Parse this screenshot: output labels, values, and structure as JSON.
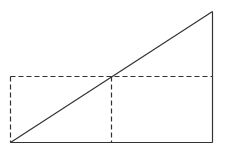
{
  "diagram": {
    "width": 226,
    "height": 154,
    "stroke_color": "#333333",
    "background": "#ffffff",
    "points": {
      "bottom_left": [
        10,
        142
      ],
      "bottom_right": [
        212,
        142
      ],
      "top_right": [
        212,
        11
      ],
      "mid_top_left": [
        10,
        76
      ],
      "mid_intersection": [
        111,
        76
      ],
      "mid_bottom": [
        111,
        142
      ],
      "mid_right": [
        212,
        76
      ]
    },
    "solid_lines": [
      {
        "name": "base-line",
        "from": [
          10,
          142
        ],
        "to": [
          212,
          142
        ]
      },
      {
        "name": "right-side-line",
        "from": [
          212,
          142
        ],
        "to": [
          212,
          11
        ]
      },
      {
        "name": "hypotenuse-line",
        "from": [
          10,
          142
        ],
        "to": [
          212,
          11
        ]
      }
    ],
    "dashed_lines": [
      {
        "name": "dashed-horizontal-midline",
        "from": [
          10,
          76
        ],
        "to": [
          212,
          76
        ]
      },
      {
        "name": "dashed-left-vertical",
        "from": [
          10,
          76
        ],
        "to": [
          10,
          142
        ]
      },
      {
        "name": "dashed-center-vertical",
        "from": [
          111,
          76
        ],
        "to": [
          111,
          142
        ]
      }
    ],
    "dash_pattern": "5 3"
  }
}
